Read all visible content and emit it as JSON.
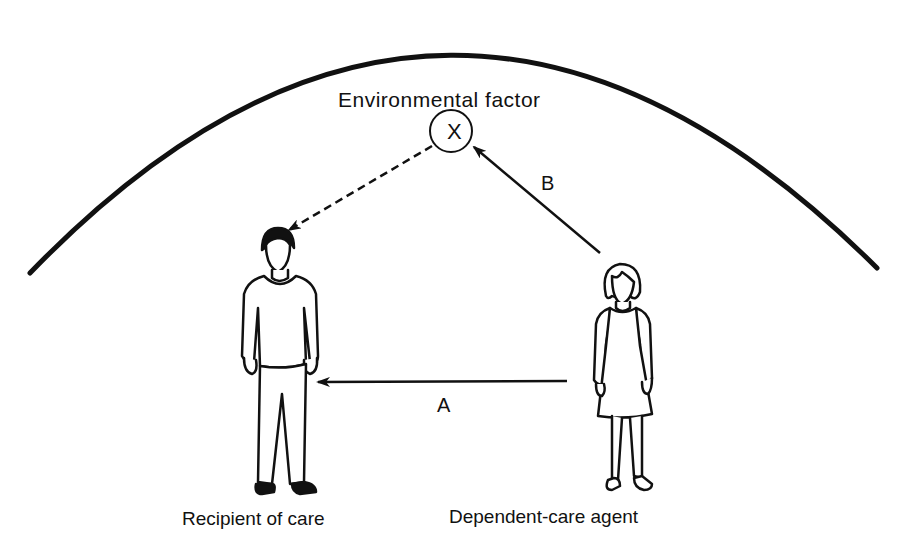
{
  "diagram": {
    "environment_boundary": "arc",
    "environmental_factor": {
      "label": "Environmental factor",
      "symbol": "X"
    },
    "arrows": {
      "a": {
        "label": "A",
        "from": "Dependent-care agent",
        "to": "Recipient of care",
        "style": "solid"
      },
      "b": {
        "label": "B",
        "from": "Dependent-care agent",
        "to": "Environmental factor",
        "style": "solid"
      },
      "dashed": {
        "label": "",
        "from": "Environmental factor",
        "to": "Recipient of care",
        "style": "dashed"
      }
    },
    "figures": {
      "recipient": {
        "label": "Recipient of care"
      },
      "agent": {
        "label": "Dependent-care agent"
      }
    },
    "colors": {
      "ink": "#111111",
      "background": "#ffffff"
    }
  }
}
